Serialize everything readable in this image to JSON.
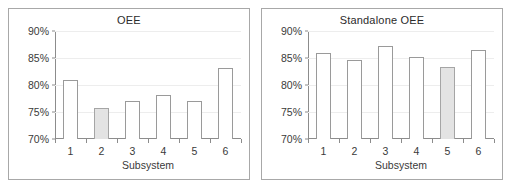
{
  "figure": {
    "background": "#ffffff",
    "panel_border_color": "#a8a8a8",
    "bar_outline_color": "#9a9a9a",
    "bar_fill_color": "#ffffff",
    "bar_highlight_fill_color": "#e3e3e3",
    "gridline_color": "#ededed"
  },
  "chart_data": [
    {
      "type": "bar",
      "title": "OEE",
      "xlabel": "Subsystem",
      "ylabel": "",
      "categories": [
        "1",
        "2",
        "3",
        "4",
        "5",
        "6"
      ],
      "values": [
        81.0,
        75.7,
        77.0,
        78.2,
        77.0,
        83.2
      ],
      "highlighted_index": 1,
      "ylim": [
        70,
        90
      ],
      "yticks": [
        70,
        75,
        80,
        85,
        90
      ],
      "ytick_labels": [
        "70%",
        "75%",
        "80%",
        "85%",
        "90%"
      ],
      "grid": true,
      "legend": "none"
    },
    {
      "type": "bar",
      "title": "Standalone OEE",
      "xlabel": "Subsystem",
      "ylabel": "",
      "categories": [
        "1",
        "2",
        "3",
        "4",
        "5",
        "6"
      ],
      "values": [
        86.0,
        84.7,
        87.3,
        85.2,
        83.3,
        86.4
      ],
      "highlighted_index": 4,
      "ylim": [
        70,
        90
      ],
      "yticks": [
        70,
        75,
        80,
        85,
        90
      ],
      "ytick_labels": [
        "70%",
        "75%",
        "80%",
        "85%",
        "90%"
      ],
      "grid": true,
      "legend": "none"
    }
  ]
}
